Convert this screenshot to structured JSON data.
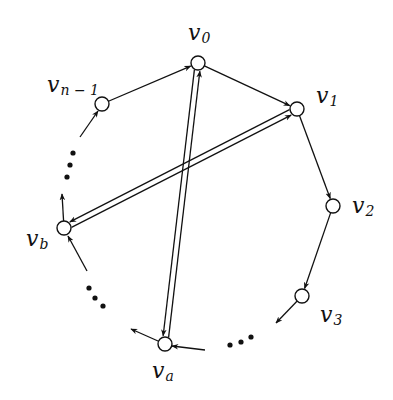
{
  "diagram": {
    "type": "directed-cycle-with-chords",
    "nodes": [
      {
        "id": "v0",
        "main": "v",
        "sub": "0",
        "x": 198,
        "y": 63,
        "lx": 188,
        "ly": 40
      },
      {
        "id": "v1",
        "main": "v",
        "sub": "1",
        "x": 297,
        "y": 109,
        "lx": 316,
        "ly": 103
      },
      {
        "id": "v2",
        "main": "v",
        "sub": "2",
        "x": 333,
        "y": 206,
        "lx": 352,
        "ly": 213
      },
      {
        "id": "v3",
        "main": "v",
        "sub": "3",
        "x": 302,
        "y": 296,
        "lx": 320,
        "ly": 322
      },
      {
        "id": "va",
        "main": "v",
        "sub": "a",
        "x": 165,
        "y": 344,
        "lx": 152,
        "ly": 378
      },
      {
        "id": "vb",
        "main": "v",
        "sub": "b",
        "x": 64,
        "y": 228,
        "lx": 26,
        "ly": 246
      },
      {
        "id": "vn1",
        "main": "v",
        "sub": "n − 1",
        "x": 102,
        "y": 104,
        "lx": 47,
        "ly": 92
      }
    ],
    "cycle_edges": [
      {
        "from": "vn1",
        "to": "v0"
      },
      {
        "from": "v0",
        "to": "v1"
      },
      {
        "from": "v1",
        "to": "v2"
      },
      {
        "from": "v2",
        "to": "v3"
      }
    ],
    "stub_edges": [
      {
        "note": "out of v3",
        "x1": 302,
        "y1": 296,
        "x2": 276,
        "y2": 323
      },
      {
        "note": "into va",
        "x1": 205,
        "y1": 350,
        "x2": 172,
        "y2": 346
      },
      {
        "note": "out of va",
        "x1": 158,
        "y1": 341,
        "x2": 131,
        "y2": 329
      },
      {
        "note": "into vb",
        "x1": 87,
        "y1": 271,
        "x2": 68,
        "y2": 236
      },
      {
        "note": "out of vb",
        "x1": 64,
        "y1": 228,
        "x2": 62,
        "y2": 194
      },
      {
        "note": "into vn1",
        "x1": 80,
        "y1": 137,
        "x2": 98,
        "y2": 111
      }
    ],
    "chords": [
      {
        "a": "v0",
        "b": "va",
        "label": "double edge v0 ↔ va"
      },
      {
        "a": "v1",
        "b": "vb",
        "label": "double edge v1 ↔ vb"
      }
    ],
    "ellipses": [
      {
        "position": "left",
        "dots": [
          [
            73,
            153
          ],
          [
            70,
            165
          ],
          [
            67,
            177
          ]
        ]
      },
      {
        "position": "lower-left",
        "dots": [
          [
            89,
            288
          ],
          [
            95,
            298
          ],
          [
            103,
            306
          ]
        ]
      },
      {
        "position": "bottom",
        "dots": [
          [
            230,
            345
          ],
          [
            241,
            342
          ],
          [
            251,
            337
          ]
        ]
      }
    ]
  }
}
